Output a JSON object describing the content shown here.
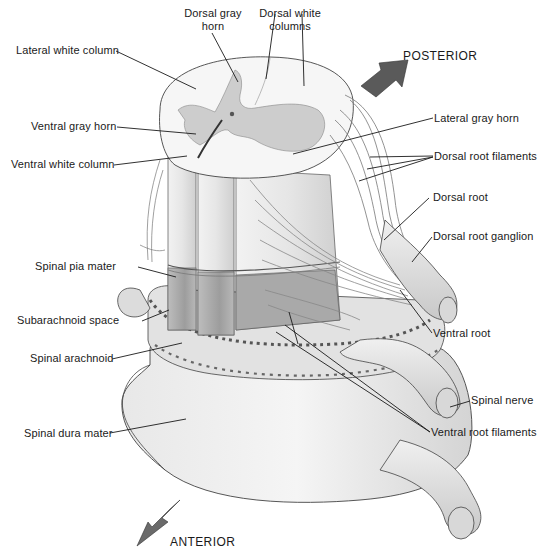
{
  "figure": {
    "orientation": {
      "posterior": "POSTERIOR",
      "anterior": "ANTERIOR"
    },
    "labels": {
      "dorsal_gray_horn_1": "Dorsal gray",
      "dorsal_gray_horn_2": "horn",
      "dorsal_white_columns_1": "Dorsal white",
      "dorsal_white_columns_2": "columns",
      "lateral_white_column": "Lateral white column",
      "ventral_gray_horn": "Ventral gray horn",
      "ventral_white_column": "Ventral white column",
      "lateral_gray_horn": "Lateral gray horn",
      "dorsal_root_filaments": "Dorsal root filaments",
      "dorsal_root": "Dorsal root",
      "dorsal_root_ganglion": "Dorsal root ganglion",
      "spinal_pia_mater": "Spinal pia mater",
      "subarachnoid_space": "Subarachnoid space",
      "spinal_arachnoid": "Spinal arachnoid",
      "ventral_root": "Ventral root",
      "spinal_nerve": "Spinal nerve",
      "spinal_dura_mater": "Spinal dura mater",
      "ventral_root_filaments": "Ventral root filaments"
    },
    "colors": {
      "ink": "#1a1a1a",
      "gray_matter": "#c9c9c9",
      "white_matter": "#f4f4f4",
      "shade": "#b5b5b5",
      "arrow": "#5a5a5a"
    }
  }
}
